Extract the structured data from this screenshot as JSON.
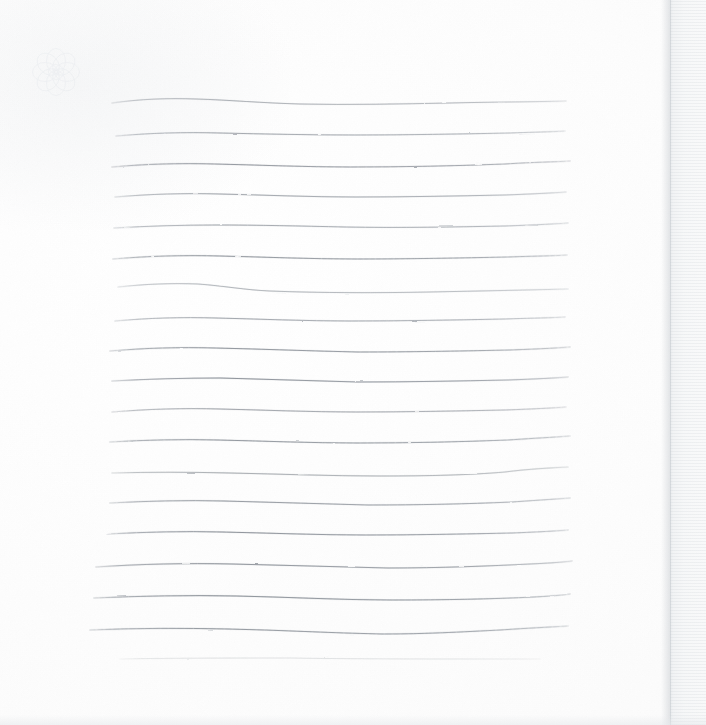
{
  "canvas": {
    "width": 706,
    "height": 725,
    "background_color": "#fdfdfd",
    "paper_color": "#ffffff",
    "description": "Scanned sheet of white drawing paper with hand-drawn horizontal pencil lines"
  },
  "watermark": {
    "name": "rosette-flower",
    "center_x": 56,
    "center_y": 72,
    "radius": 26,
    "petals": 8,
    "color": "#e2e6ea",
    "opacity": 0.4,
    "visible_label": ""
  },
  "edge": {
    "name": "paper-right-edge",
    "x": 670,
    "width": 36,
    "color": "#eef0f2",
    "shadow_color": "#bcc1c7"
  },
  "bottom_band": {
    "name": "scanner-bottom-band",
    "height": 10,
    "color": "#e6e9ec"
  },
  "chart_data": {
    "type": "line",
    "title": "",
    "subtitle": "",
    "xlabel": "",
    "ylabel": "",
    "grid": false,
    "legend": "none",
    "xlim": [
      0,
      706
    ],
    "ylim": [
      0,
      725
    ],
    "annotations": [],
    "stroke_color": "#8d939b",
    "line_count": 19,
    "mean_spacing": 30,
    "x_start_mean": 110,
    "x_end_mean": 568,
    "series": [
      {
        "name": "line-01",
        "y": 100,
        "x_start": 112,
        "x_end": 566,
        "opacity": 0.62,
        "thickness": 0.9,
        "path": "M112,103 C140,99 168,98 196,99 C230,100 262,103 300,104 C350,105 400,104 450,103 C490,102 530,102 566,101"
      },
      {
        "name": "line-02",
        "y": 133,
        "x_start": 116,
        "x_end": 565,
        "opacity": 0.7,
        "thickness": 0.9,
        "path": "M116,136 C150,133 185,132 220,133 C265,134 310,135 355,135 C405,135 460,134 510,133 C535,132 552,132 565,131"
      },
      {
        "name": "line-03",
        "y": 164,
        "x_start": 112,
        "x_end": 570,
        "opacity": 0.78,
        "thickness": 1.0,
        "path": "M112,167 C145,164 180,163 215,164 C260,165 305,167 350,167 C400,167 455,166 505,164 C535,162 555,162 570,161"
      },
      {
        "name": "line-04",
        "y": 194,
        "x_start": 115,
        "x_end": 566,
        "opacity": 0.72,
        "thickness": 0.9,
        "path": "M115,197 C150,194 185,193 220,194 C265,195 310,197 355,197 C405,197 455,196 505,195 C532,194 552,193 566,192"
      },
      {
        "name": "line-05",
        "y": 225,
        "x_start": 114,
        "x_end": 568,
        "opacity": 0.7,
        "thickness": 0.9,
        "path": "M114,228 C148,226 182,225 216,225 C258,225 300,226 345,227 C400,228 455,227 505,226 C534,225 554,224 568,223"
      },
      {
        "name": "line-06",
        "y": 257,
        "x_start": 113,
        "x_end": 567,
        "opacity": 0.8,
        "thickness": 1.0,
        "path": "M113,259 C148,256 184,255 220,256 C265,257 310,259 356,259 C408,259 460,258 508,257 C535,256 554,256 567,255"
      },
      {
        "name": "line-07",
        "y": 287,
        "x_start": 118,
        "x_end": 568,
        "opacity": 0.58,
        "thickness": 0.9,
        "path": "M118,287 C145,284 172,283 198,284 C225,286 245,290 270,291 C320,293 380,293 430,292 C480,291 530,290 568,289"
      },
      {
        "name": "line-08",
        "y": 318,
        "x_start": 115,
        "x_end": 565,
        "opacity": 0.72,
        "thickness": 0.9,
        "path": "M115,321 C148,318 182,317 216,318 C260,319 305,321 350,321 C400,321 455,320 505,319 C532,318 552,318 565,317"
      },
      {
        "name": "line-09",
        "y": 349,
        "x_start": 110,
        "x_end": 570,
        "opacity": 0.82,
        "thickness": 1.0,
        "path": "M110,351 C145,348 180,347 215,348 C262,349 310,351 358,352 C410,352 462,351 510,350 C538,349 558,348 570,347"
      },
      {
        "name": "line-10",
        "y": 379,
        "x_start": 112,
        "x_end": 568,
        "opacity": 0.84,
        "thickness": 1.0,
        "path": "M112,381 C148,379 184,378 220,378 C266,379 312,381 358,382 C408,382 458,381 508,380 C536,379 556,378 568,377"
      },
      {
        "name": "line-11",
        "y": 409,
        "x_start": 112,
        "x_end": 566,
        "opacity": 0.74,
        "thickness": 0.9,
        "path": "M112,412 C148,409 184,408 220,409 C265,410 310,412 356,412 C406,412 456,411 505,410 C533,409 553,408 566,407"
      },
      {
        "name": "line-12",
        "y": 440,
        "x_start": 110,
        "x_end": 570,
        "opacity": 0.8,
        "thickness": 1.0,
        "path": "M110,442 C145,440 182,439 218,440 C264,441 310,443 358,443 C408,443 458,442 508,440 C538,438 558,437 570,436"
      },
      {
        "name": "line-13",
        "y": 470,
        "x_start": 112,
        "x_end": 568,
        "opacity": 0.66,
        "thickness": 0.9,
        "path": "M112,473 C150,472 190,472 230,473 C280,474 330,476 380,476 C430,476 470,475 505,472 C528,469 550,468 568,467"
      },
      {
        "name": "line-14",
        "y": 501,
        "x_start": 110,
        "x_end": 570,
        "opacity": 0.76,
        "thickness": 1.0,
        "path": "M110,503 C148,501 186,500 224,501 C272,502 320,504 368,505 C418,505 466,504 512,502 C540,500 558,499 570,498"
      },
      {
        "name": "line-15",
        "y": 532,
        "x_start": 108,
        "x_end": 568,
        "opacity": 0.84,
        "thickness": 1.0,
        "path": "M108,534 C146,532 184,531 222,532 C270,533 318,535 366,535 C416,535 464,534 512,533 C538,532 556,531 568,530"
      },
      {
        "name": "line-16",
        "y": 563,
        "x_start": 96,
        "x_end": 572,
        "opacity": 0.82,
        "thickness": 1.0,
        "path": "M96,567 C140,564 186,563 232,564 C284,565 336,567 388,568 C440,568 490,566 530,564 C552,563 565,562 572,561"
      },
      {
        "name": "line-17",
        "y": 595,
        "x_start": 94,
        "x_end": 570,
        "opacity": 0.86,
        "thickness": 1.0,
        "path": "M94,598 C140,596 188,595 236,596 C288,597 340,600 392,600 C444,600 494,599 534,597 C554,596 564,595 570,594"
      },
      {
        "name": "line-18",
        "y": 628,
        "x_start": 90,
        "x_end": 568,
        "opacity": 0.8,
        "thickness": 1.0,
        "path": "M90,630 C136,628 182,628 228,629 C280,630 330,633 382,634 C426,634 460,632 500,630 C530,628 552,627 568,626"
      },
      {
        "name": "line-19",
        "y": 658,
        "x_start": 120,
        "x_end": 540,
        "opacity": 0.22,
        "thickness": 0.8,
        "path": "M120,659 C170,658 230,658 290,658 C350,659 420,659 480,659 C510,659 528,659 540,659"
      }
    ]
  }
}
